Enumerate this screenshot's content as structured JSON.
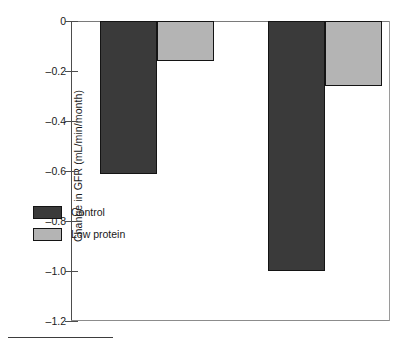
{
  "chart_data": {
    "type": "bar",
    "title": "",
    "subtitle": "",
    "xlabel": "",
    "ylabel": "Change in GFR (mL/min/month)",
    "categories": [
      "Group 1",
      "Group 2"
    ],
    "series": [
      {
        "name": "Control",
        "color": "#3a3a3a",
        "values": [
          -0.61,
          -1.0
        ]
      },
      {
        "name": "Low protein",
        "color": "#b4b4b4",
        "values": [
          -0.16,
          -0.26
        ]
      }
    ],
    "ylim": [
      -1.2,
      0
    ],
    "yticks": [
      0,
      -0.2,
      -0.4,
      -0.6,
      -0.8,
      -1.0,
      -1.2
    ],
    "ytick_labels": [
      "0",
      "–0.2",
      "–0.4",
      "–0.6",
      "–0.8",
      "–1.0",
      "–1.2"
    ],
    "grid": false,
    "legend_position": "inside-lower-left",
    "xtick_labels": []
  },
  "legend": {
    "items": [
      {
        "label": "Control",
        "color": "#3a3a3a"
      },
      {
        "label": "Low protein",
        "color": "#b4b4b4"
      }
    ]
  },
  "axis": {
    "y_title": "Change in GFR (mL/min/month)"
  },
  "colors": {
    "control": "#3a3a3a",
    "low_protein": "#b4b4b4",
    "axis": "#4d4d4d",
    "bar_outline": "#141414"
  }
}
